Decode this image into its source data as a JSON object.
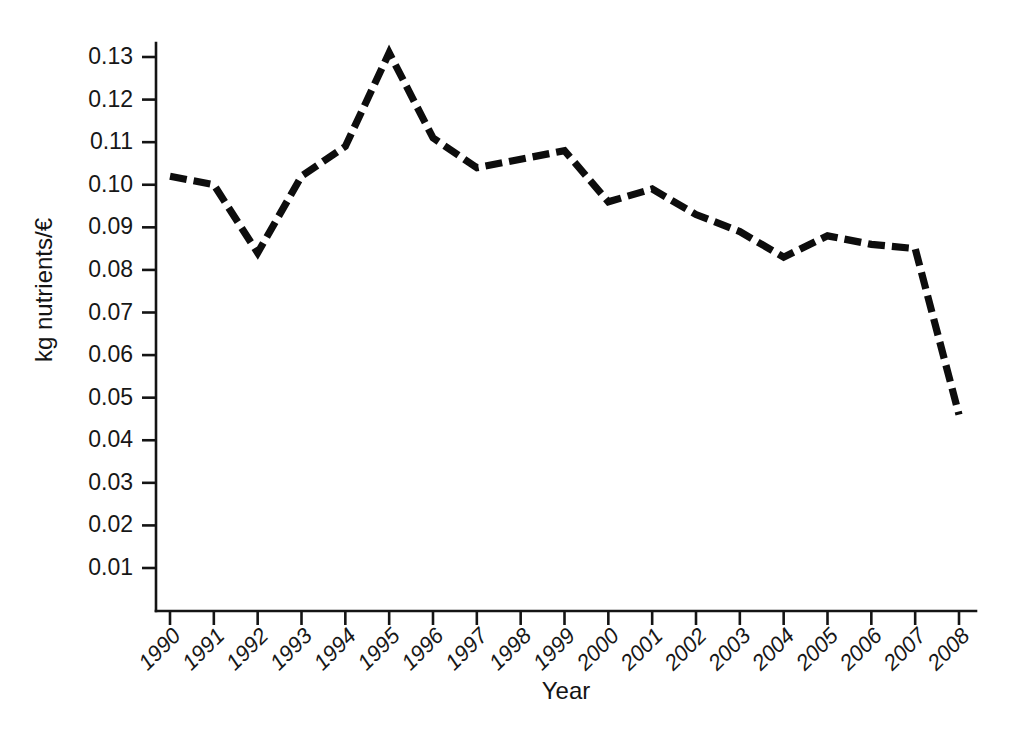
{
  "chart_data": {
    "type": "line",
    "title": "",
    "xlabel": "Year",
    "ylabel": "kg nutrients/€",
    "categories": [
      "1990",
      "1991",
      "1992",
      "1993",
      "1994",
      "1995",
      "1996",
      "1997",
      "1998",
      "1999",
      "2000",
      "2001",
      "2002",
      "2003",
      "2004",
      "2005",
      "2006",
      "2007",
      "2008"
    ],
    "values": [
      0.102,
      0.1,
      0.084,
      0.102,
      0.109,
      0.131,
      0.111,
      0.104,
      0.106,
      0.108,
      0.096,
      0.099,
      0.093,
      0.089,
      0.083,
      0.088,
      0.086,
      0.085,
      0.046
    ],
    "series": [
      {
        "name": "kg nutrients per euro",
        "values": [
          0.102,
          0.1,
          0.084,
          0.102,
          0.109,
          0.131,
          0.111,
          0.104,
          0.106,
          0.108,
          0.096,
          0.099,
          0.093,
          0.089,
          0.083,
          0.088,
          0.086,
          0.085,
          0.046
        ]
      }
    ],
    "ytick_labels": [
      "0.13",
      "0.12",
      "0.11",
      "0.10",
      "0.09",
      "0.08",
      "0.07",
      "0.06",
      "0.05",
      "0.04",
      "0.03",
      "0.02",
      "0.01"
    ],
    "ytick_values": [
      0.13,
      0.12,
      0.11,
      0.1,
      0.09,
      0.08,
      0.07,
      0.06,
      0.05,
      0.04,
      0.03,
      0.02,
      0.01
    ],
    "ylim": [
      0.0,
      0.1355
    ],
    "xlim": [
      "1990",
      "2008"
    ],
    "grid": false,
    "legend": "none",
    "line_style": "dashed",
    "line_color": "#0d0d0d",
    "background_color": "#ffffff",
    "axis_color": "#141414"
  }
}
